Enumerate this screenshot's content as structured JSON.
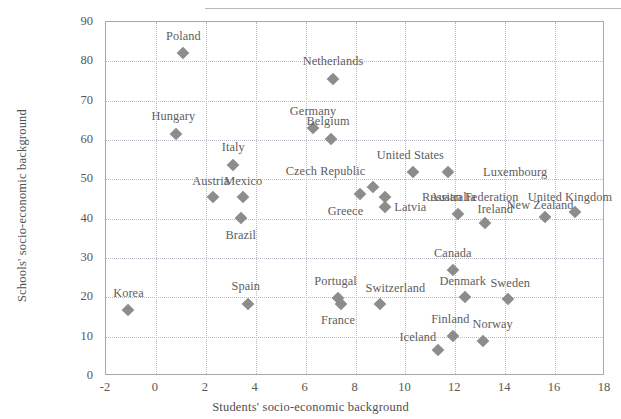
{
  "chart_data": {
    "type": "scatter",
    "title": "",
    "xlabel": "Students' socio-economic background",
    "ylabel": "Schools' socio-economic background",
    "xlim": [
      -2,
      18
    ],
    "ylim": [
      0,
      90
    ],
    "xticks": [
      -2,
      0,
      2,
      4,
      6,
      8,
      10,
      12,
      14,
      16,
      18
    ],
    "yticks": [
      0,
      10,
      20,
      30,
      40,
      50,
      60,
      70,
      80,
      90
    ],
    "grid": true,
    "legend": "none",
    "marker": "diamond",
    "marker_color": "#8c8c8c",
    "points": [
      {
        "label": "Poland",
        "x": 1.1,
        "y": 82.0,
        "lx": 1.1,
        "ly": 86.5
      },
      {
        "label": "Netherlands",
        "x": 7.1,
        "y": 75.5,
        "lx": 7.1,
        "ly": 80.2
      },
      {
        "label": "Germany",
        "x": 6.3,
        "y": 63.0,
        "lx": 6.3,
        "ly": 67.3
      },
      {
        "label": "Hungary",
        "x": 0.8,
        "y": 61.5,
        "lx": 0.7,
        "ly": 66.0
      },
      {
        "label": "Belgium",
        "x": 7.0,
        "y": 60.3,
        "lx": 6.9,
        "ly": 64.8
      },
      {
        "label": "Italy",
        "x": 3.1,
        "y": 53.7,
        "lx": 3.1,
        "ly": 58.2
      },
      {
        "label": "United States",
        "x": 10.3,
        "y": 51.8,
        "lx": 10.2,
        "ly": 56.3
      },
      {
        "label": "Luxembourg",
        "x": 11.7,
        "y": 51.8,
        "lx": 14.4,
        "ly": 51.8
      },
      {
        "label": "Czech Republic",
        "x": 8.7,
        "y": 48.0,
        "lx": 6.8,
        "ly": 52.2
      },
      {
        "label": "Russian Federation",
        "x": 9.2,
        "y": 45.6,
        "lx": 12.6,
        "ly": 45.6
      },
      {
        "label": "Greece",
        "x": 8.2,
        "y": 46.3,
        "lx": 7.6,
        "ly": 42.0
      },
      {
        "label": "Latvia",
        "x": 9.2,
        "y": 43.0,
        "lx": 10.2,
        "ly": 43.0
      },
      {
        "label": "Austria",
        "x": 2.3,
        "y": 45.4,
        "lx": 2.2,
        "ly": 49.7
      },
      {
        "label": "Mexico",
        "x": 3.5,
        "y": 45.4,
        "lx": 3.5,
        "ly": 49.7
      },
      {
        "label": "Brazil",
        "x": 3.4,
        "y": 40.1,
        "lx": 3.4,
        "ly": 35.8
      },
      {
        "label": "Australia",
        "x": 12.1,
        "y": 41.3,
        "lx": 11.9,
        "ly": 45.5
      },
      {
        "label": "Ireland",
        "x": 13.2,
        "y": 38.8,
        "lx": 13.6,
        "ly": 42.5
      },
      {
        "label": "New Zealand",
        "x": 15.6,
        "y": 40.5,
        "lx": 15.4,
        "ly": 43.6
      },
      {
        "label": "United Kingdom",
        "x": 16.8,
        "y": 41.8,
        "lx": 16.6,
        "ly": 45.6
      },
      {
        "label": "Canada",
        "x": 11.9,
        "y": 27.0,
        "lx": 11.9,
        "ly": 31.2
      },
      {
        "label": "Denmark",
        "x": 12.4,
        "y": 20.0,
        "lx": 12.3,
        "ly": 24.2
      },
      {
        "label": "Sweden",
        "x": 14.1,
        "y": 19.5,
        "lx": 14.2,
        "ly": 23.6
      },
      {
        "label": "Portugal",
        "x": 7.3,
        "y": 19.8,
        "lx": 7.2,
        "ly": 24.2
      },
      {
        "label": "Switzerland",
        "x": 9.0,
        "y": 18.2,
        "lx": 9.6,
        "ly": 22.5
      },
      {
        "label": "France",
        "x": 7.4,
        "y": 18.2,
        "lx": 7.3,
        "ly": 14.2
      },
      {
        "label": "Spain",
        "x": 3.7,
        "y": 18.4,
        "lx": 3.6,
        "ly": 22.8
      },
      {
        "label": "Finland",
        "x": 11.9,
        "y": 10.2,
        "lx": 11.8,
        "ly": 14.5
      },
      {
        "label": "Norway",
        "x": 13.1,
        "y": 9.0,
        "lx": 13.5,
        "ly": 13.1
      },
      {
        "label": "Iceland",
        "x": 11.3,
        "y": 6.5,
        "lx": 10.5,
        "ly": 10.0
      },
      {
        "label": "Korea",
        "x": -1.1,
        "y": 16.8,
        "lx": -1.1,
        "ly": 21.2
      }
    ]
  }
}
